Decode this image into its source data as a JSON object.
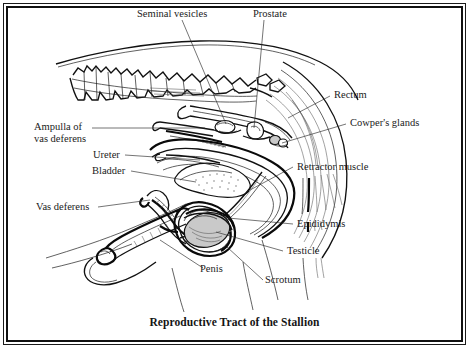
{
  "figure": {
    "title": "Reproductive Tract of the Stallion",
    "frame_color": "#111111",
    "background_color": "#ffffff",
    "ink_color": "#111111",
    "label_color": "#1b1b1b"
  },
  "labels": {
    "seminal_vesicles": "Seminal vesicles",
    "prostate": "Prostate",
    "rectum": "Rectum",
    "cowpers_glands": "Cowper's glands",
    "ampulla_of_vas_deferens": "Ampulla of vas deferens",
    "ampulla_line_1": "Ampulla of",
    "ampulla_line_2": "vas deferens",
    "ureter": "Ureter",
    "bladder": "Bladder",
    "retractor_muscle": "Retractor muscle",
    "vas_deferens": "Vas deferens",
    "epididymis": "Epididymis",
    "testicle": "Testicle",
    "penis": "Penis",
    "scrotum": "Scrotum"
  },
  "structures": [
    "vertebral-column",
    "back-outline",
    "rectum",
    "prostate",
    "seminal-vesicles",
    "cowpers-glands",
    "bladder",
    "ureter",
    "ampulla-of-vas-deferens",
    "vas-deferens",
    "retractor-muscle",
    "epididymis",
    "testicle",
    "scrotum",
    "penis",
    "hindquarter-contours",
    "tail-hair"
  ]
}
